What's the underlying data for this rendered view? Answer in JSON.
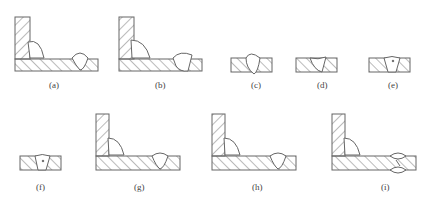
{
  "header": {
    "partial_text": "焊缝常见缺陷"
  },
  "figures": [
    {
      "id": "a",
      "label": "(a)",
      "type": "t-joint",
      "description": "T-joint fillet weld with butt weld on base plate"
    },
    {
      "id": "b",
      "label": "(b)",
      "type": "t-joint",
      "description": "T-joint with irregular fillet and butt weld"
    },
    {
      "id": "c",
      "label": "(c)",
      "type": "butt-plate",
      "description": "Butt weld with excess reinforcement"
    },
    {
      "id": "d",
      "label": "(d)",
      "type": "butt-plate",
      "description": "Butt weld underfill / misaligned"
    },
    {
      "id": "e",
      "label": "(e)",
      "type": "butt-plate",
      "description": "Butt weld with porosity"
    },
    {
      "id": "f",
      "label": "(f)",
      "type": "butt-plate",
      "description": "Butt weld with slag inclusion"
    },
    {
      "id": "g",
      "label": "(g)",
      "type": "t-joint",
      "description": "T-joint with fillet weld and butt weld"
    },
    {
      "id": "h",
      "label": "(h)",
      "type": "t-joint",
      "description": "T-joint with fillet weld and butt weld"
    },
    {
      "id": "i",
      "label": "(i)",
      "type": "t-joint",
      "description": "T-joint with double-sided butt weld"
    }
  ],
  "colors": {
    "stroke": "#666666",
    "hatch": "#777777",
    "background": "#ffffff"
  }
}
